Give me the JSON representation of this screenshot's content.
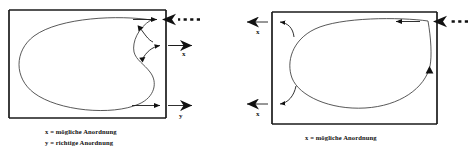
{
  "figure": {
    "panels": [
      {
        "id": "left-panel",
        "caption_lines": [
          "x = mögliche Anordnung",
          "y = richtige Anordnung"
        ],
        "labels": [
          {
            "name": "x",
            "text": "x"
          },
          {
            "name": "y",
            "text": "y"
          }
        ],
        "markers": {
          "dashed_inflow": "· · ·"
        }
      },
      {
        "id": "right-panel",
        "caption_lines": [
          "x = mögliche Anordnung"
        ],
        "labels": [
          {
            "name": "x-top",
            "text": "x"
          },
          {
            "name": "x-bottom",
            "text": "x"
          }
        ],
        "markers": {
          "dashed_inflow": "· · ·"
        }
      }
    ]
  },
  "colors": {
    "box_stroke": "#1a1a1a",
    "loop_stroke": "#3a3a3a",
    "arrow_fill": "#111111",
    "text": "#111111",
    "background": "#ffffff"
  }
}
